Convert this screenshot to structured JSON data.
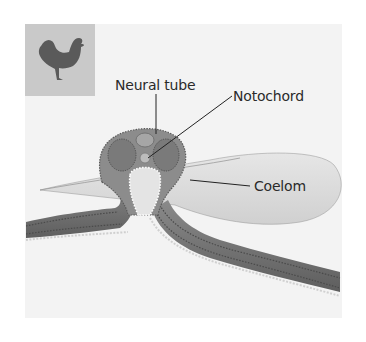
{
  "figure": {
    "icon": "chicken-icon",
    "labels": {
      "neural_tube": "Neural tube",
      "notochord": "Notochord",
      "coelom": "Coelom"
    },
    "colors": {
      "background": "#ffffff",
      "panel": "#f3f3f3",
      "icon_box": "#c9c9c9",
      "icon": "#5a5a5a",
      "tissue_dark": "#6e6e6e",
      "tissue_mid": "#9a9a9a",
      "tissue_light": "#d2d2d2",
      "label_text": "#2a2a2a"
    }
  }
}
